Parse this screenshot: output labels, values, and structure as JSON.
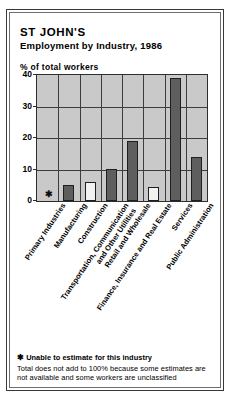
{
  "title": {
    "main": "ST JOHN'S",
    "sub": "Employment by Industry, 1986"
  },
  "axis": {
    "ylabel": "% of total workers",
    "yticks": [
      "0",
      "10",
      "20",
      "30",
      "40"
    ]
  },
  "footnotes": {
    "star_marker": "✱",
    "star_text": "Unable to estimate for this industry",
    "line1": "Total does not add to 100% because some estimates are",
    "line2": "not available and some workers are unclassified"
  },
  "colors": {
    "plot_background": "#c9c9c9",
    "bar_filled": "#5e5e5e",
    "bar_hollow": "#f2f2f2",
    "gridline": "#3c3c3c",
    "outline": "#1f1f1f"
  },
  "chart_data": {
    "type": "bar",
    "xlabel": "",
    "ylabel": "% of total workers",
    "ylim": [
      0,
      40
    ],
    "yticks": [
      0,
      10,
      20,
      30,
      40
    ],
    "grid": true,
    "legend": "none",
    "categories": [
      "Primary Industries",
      "Manufacturing",
      "Construction",
      "Transportation, Communication\nand Other Utilities",
      "Retail and Wholesale",
      "Finance, Insurance and Real Estate",
      "Services",
      "Public Administration"
    ],
    "values": [
      null,
      5.0,
      6.0,
      10.0,
      19.0,
      4.5,
      39.0,
      14.0
    ],
    "bar_styles": [
      "none",
      "filled",
      "hollow",
      "filled",
      "filled",
      "hollow",
      "filled",
      "filled"
    ],
    "notes": {
      "Primary Industries": "✱ Unable to estimate for this industry"
    },
    "annotations": [
      "✱ Unable to estimate for this industry",
      "Total does not add to 100% because some estimates are not available and some workers are unclassified"
    ]
  }
}
